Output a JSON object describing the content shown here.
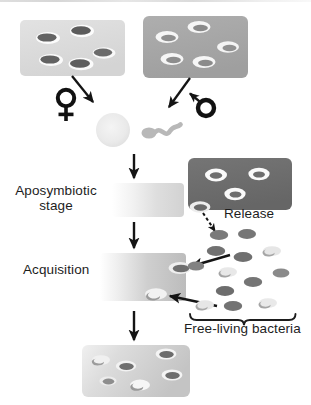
{
  "figure": {
    "type": "biological-cycle-diagram",
    "title_present": false,
    "background_color": "#ffffff",
    "artifact": "scan-line-top"
  },
  "labels": {
    "aposymbiotic_line1": "Aposymbiotic",
    "aposymbiotic_line2": "stage",
    "acquisition": "Acquisition",
    "release": "Release",
    "free_living": "Free-living bacteria"
  },
  "symbols": {
    "female": "female-symbol",
    "male": "male-symbol"
  },
  "colors": {
    "tissue_light": "#dcdcdc",
    "tissue_medium": "#a8a8a8",
    "tissue_dark": "#6e6e6e",
    "bacteria_dark": "#636363",
    "bacteria_light": "#c6c6c6",
    "halo": "#ffffff",
    "arrow": "#141414",
    "text": "#1d1d1d"
  },
  "panels": [
    {
      "id": "maternal-tissue",
      "name": "light-tissue-block-top-left",
      "fill": "#dcdcdc",
      "x": 20,
      "y": 20,
      "w": 105,
      "h": 56,
      "bacteria_count": 5,
      "bacteria_style": "dark-filled-with-halo"
    },
    {
      "id": "paternal-tissue",
      "name": "medium-tissue-block-top-right",
      "fill": "#a8a8a8",
      "x": 143,
      "y": 16,
      "w": 105,
      "h": 62,
      "bacteria_count": 5,
      "bacteria_style": "white-ring"
    },
    {
      "id": "aposymbiotic-block",
      "name": "aposymbiotic-stage-block",
      "fill": "gradient-white-to-lightgray",
      "x": 112,
      "y": 183,
      "w": 72,
      "h": 34,
      "bacteria_count": 0
    },
    {
      "id": "acquisition-block",
      "name": "acquisition-stage-block",
      "fill": "gradient-white-to-gray",
      "x": 100,
      "y": 253,
      "w": 86,
      "h": 48,
      "bacteria_count": 2,
      "bacteria_style": "entering-at-right-edge"
    },
    {
      "id": "host-tissue-dark",
      "name": "dark-tissue-block-release",
      "fill": "#6e6e6e",
      "x": 188,
      "y": 158,
      "w": 104,
      "h": 52,
      "bacteria_count": 4,
      "bacteria_style": "white-ring"
    },
    {
      "id": "symbiotic-block",
      "name": "symbiotic-tissue-block-bottom",
      "fill": "gradient-light-gray",
      "x": 82,
      "y": 345,
      "w": 108,
      "h": 52,
      "bacteria_count": 6,
      "bacteria_style": "mixed"
    }
  ],
  "free_living_field": {
    "name": "free-living-bacteria-field",
    "count": 13,
    "region": {
      "x": 190,
      "y": 222,
      "w": 110,
      "h": 90
    }
  },
  "arrows": [
    {
      "name": "female-to-egg-arrow",
      "style": "solid",
      "direction": "down-right"
    },
    {
      "name": "male-to-sperm-arrow",
      "style": "solid",
      "direction": "down-left"
    },
    {
      "name": "male-symbol-pointer-arrow",
      "style": "solid",
      "direction": "up-left"
    },
    {
      "name": "zygote-to-aposymbiotic-arrow",
      "style": "solid",
      "direction": "down"
    },
    {
      "name": "aposymbiotic-to-acquisition-arrow",
      "style": "solid",
      "direction": "down"
    },
    {
      "name": "acquisition-to-symbiotic-arrow",
      "style": "solid",
      "direction": "down"
    },
    {
      "name": "release-arrow",
      "style": "dotted",
      "direction": "down-right"
    },
    {
      "name": "uptake-arrow-upper",
      "style": "solid",
      "direction": "left"
    },
    {
      "name": "uptake-arrow-lower",
      "style": "solid",
      "direction": "left"
    }
  ],
  "gametes": [
    {
      "name": "egg-cell",
      "shape": "circle",
      "fill": "#ededed"
    },
    {
      "name": "sperm-cell",
      "shape": "oval-with-flagellum",
      "fill": "#b4b4b4"
    }
  ],
  "brace": {
    "name": "free-living-brace",
    "orientation": "down"
  }
}
